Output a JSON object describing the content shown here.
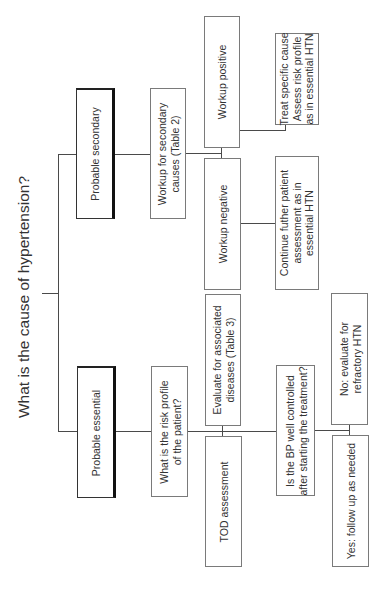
{
  "title": "What is the cause of hypertension?",
  "colors": {
    "line": "#4a4a4a",
    "box_border": "#7a7a7a",
    "text": "#333333",
    "background": "#ffffff"
  },
  "nodes": {
    "probable_secondary": "Probable secondary",
    "probable_essential": "Probable essential",
    "workup_secondary": "Workup for secondary\ncauses (Table 2)",
    "risk_profile": "What is the risk profile\nof the patient?",
    "workup_positive": "Workup positive",
    "workup_negative": "Workup negative",
    "treat_specific": "Treat specific cause\nAssess risk profile\nas in essential HTN",
    "continue_assessment": "Continue futher patient\nassessment as in\nessential HTN",
    "evaluate_associated": "Evaluate for associated\ndiseases (Table 3)",
    "tod_assessment": "TOD assessment",
    "bp_controlled": "Is the BP well controlled\nafter starting the treatment?",
    "no_refractory": "No: evaluate for\nrefractory HTN",
    "yes_follow_up": "Yes: follow up as needed"
  }
}
